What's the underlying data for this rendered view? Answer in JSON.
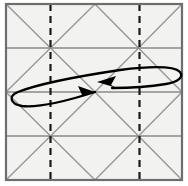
{
  "figure": {
    "title": "Origami crease pattern with swivel-fold arrow",
    "type": "crease-pattern-diagram",
    "width": 188,
    "height": 186,
    "background_color": "#ffffff"
  },
  "colors": {
    "paper_fill": "#f2f2f0",
    "border_stroke": "#6e6e6e",
    "grid_stroke": "#8a8a8a",
    "diagonal_stroke": "#9a9a9a",
    "dashed_stroke": "#1a1a1a",
    "arrow_stroke": "#000000"
  },
  "paper": {
    "name": "square-sheet",
    "left": 6,
    "top": 4,
    "right": 182,
    "bottom": 180,
    "border_width": 2.2
  },
  "grid": {
    "vertical_lines": [
      6,
      50.5,
      95,
      139.5,
      182
    ],
    "horizontal_lines": [
      4,
      48,
      92,
      136,
      180
    ],
    "stroke_width": 1.4,
    "cell_count_x": 4,
    "cell_count_y": 4
  },
  "horizontal_creases": [
    {
      "name": "crease-h-1",
      "y": 48,
      "x1": 6,
      "x2": 182
    },
    {
      "name": "crease-h-2",
      "y": 92,
      "x1": 6,
      "x2": 182
    },
    {
      "name": "crease-h-3",
      "y": 136,
      "x1": 6,
      "x2": 182
    }
  ],
  "diagonals": [
    {
      "name": "diag-down-1",
      "x1": 6,
      "y1": 4,
      "x2": 95,
      "y2": 92
    },
    {
      "name": "diag-down-2",
      "x1": 95,
      "y1": 92,
      "x2": 182,
      "y2": 180
    },
    {
      "name": "diag-down-3",
      "x1": 95,
      "y1": 4,
      "x2": 182,
      "y2": 92
    },
    {
      "name": "diag-down-4",
      "x1": 6,
      "y1": 92,
      "x2": 95,
      "y2": 180
    },
    {
      "name": "diag-up-1",
      "x1": 6,
      "y1": 92,
      "x2": 95,
      "y2": 4
    },
    {
      "name": "diag-up-2",
      "x1": 95,
      "y1": 180,
      "x2": 182,
      "y2": 92
    },
    {
      "name": "diag-up-3",
      "x1": 95,
      "y1": 92,
      "x2": 182,
      "y2": 4
    },
    {
      "name": "diag-up-4",
      "x1": 6,
      "y1": 180,
      "x2": 95,
      "y2": 92
    }
  ],
  "dashed_folds": [
    {
      "name": "dashed-fold-left",
      "x": 50.5,
      "y1": 4,
      "y2": 180,
      "dash": "7 5",
      "width": 2.2
    },
    {
      "name": "dashed-fold-right",
      "x": 139.5,
      "y1": 4,
      "y2": 180,
      "dash": "7 5",
      "width": 2.2
    }
  ],
  "star_nodes": [
    {
      "name": "node-upper-left",
      "x": 50.5,
      "y": 48
    },
    {
      "name": "node-upper-right",
      "x": 139.5,
      "y": 48
    },
    {
      "name": "node-lower-left",
      "x": 50.5,
      "y": 136
    },
    {
      "name": "node-lower-right",
      "x": 139.5,
      "y": 136
    }
  ],
  "arrow": {
    "name": "swivel-loop-arrow",
    "kind": "double-headed-flat-loop",
    "stroke_width": 2.3,
    "color": "#000000",
    "meaning": "swivel / flatten both sides toward center",
    "loop_path": "M 95 92 C 70 100, 40 108, 22 106 C 10 104, 8 96, 18 92 C 38 84, 80 76, 120 70 C 152 66, 174 66, 180 72 C 184 77, 178 82, 166 84 C 148 87, 126 88, 112 88",
    "head_left": {
      "name": "arrowhead-left",
      "tip_x": 95,
      "tip_y": 92,
      "points": "95,92 78,86 82,95 77,98"
    },
    "head_right": {
      "name": "arrowhead-right",
      "tip_x": 97,
      "tip_y": 82,
      "points": "97,82 116,76 111,85 117,88"
    }
  }
}
